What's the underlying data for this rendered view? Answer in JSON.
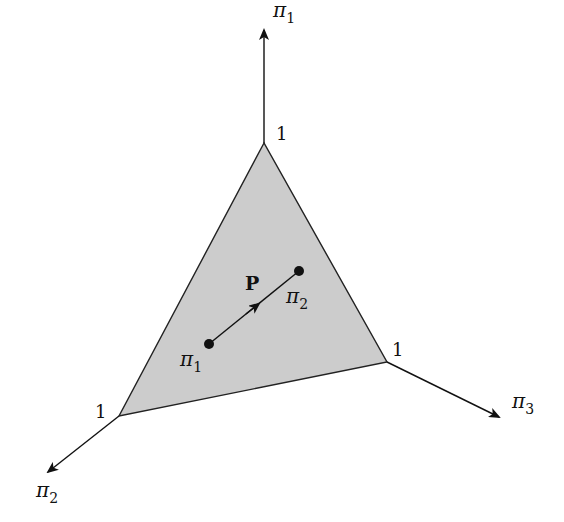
{
  "diagram": {
    "axes": [
      {
        "name": "pi1",
        "label": "π",
        "sub": "1",
        "tick": "1"
      },
      {
        "name": "pi2",
        "label": "π",
        "sub": "2",
        "tick": "1"
      },
      {
        "name": "pi3",
        "label": "π",
        "sub": "3",
        "tick": "1"
      }
    ],
    "simplex": {
      "fill": "#cccccc",
      "stroke": "#222222"
    },
    "points": [
      {
        "name": "start",
        "label": "π",
        "sub": "1"
      },
      {
        "name": "end",
        "label": "π",
        "sub": "2"
      }
    ],
    "matrix_label": "P"
  }
}
